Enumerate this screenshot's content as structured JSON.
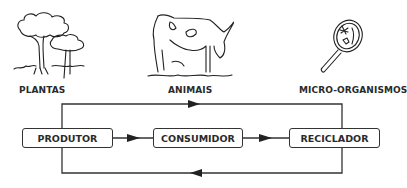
{
  "categories": [
    {
      "id": "plantas",
      "label": "PLANTAS",
      "icon": "trees-icon"
    },
    {
      "id": "animais",
      "label": "ANIMAIS",
      "icon": "cow-icon"
    },
    {
      "id": "micro",
      "label": "MICRO-ORGANISMOS",
      "icon": "magnifying-glass-microbes-icon"
    }
  ],
  "flow": {
    "nodes": [
      {
        "id": "produtor",
        "label": "PRODUTOR"
      },
      {
        "id": "consumidor",
        "label": "CONSUMIDOR"
      },
      {
        "id": "reciclador",
        "label": "RECICLADOR"
      }
    ],
    "edges": [
      {
        "from": "produtor",
        "to": "consumidor",
        "path": "direct"
      },
      {
        "from": "consumidor",
        "to": "reciclador",
        "path": "direct"
      },
      {
        "from": "produtor",
        "to": "reciclador",
        "path": "top-loop"
      },
      {
        "from": "reciclador",
        "to": "produtor",
        "path": "bottom-loop"
      }
    ]
  },
  "colors": {
    "line": "#333333",
    "text": "#2a2a2a",
    "background": "#ffffff"
  }
}
